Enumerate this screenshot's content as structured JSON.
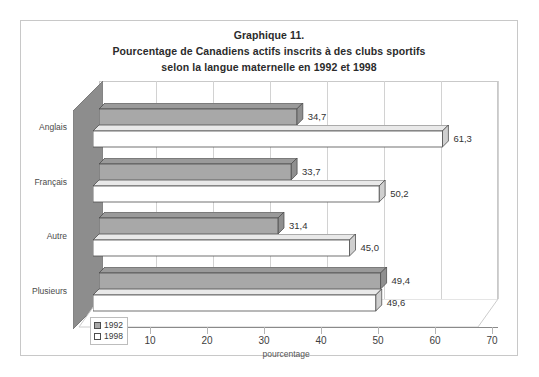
{
  "chart_data": {
    "type": "bar",
    "orientation": "horizontal",
    "title_lines": [
      "Graphique 11.",
      "Pourcentage de Canadiens actifs inscrits à des clubs sportifs",
      "selon la langue maternelle en 1992 et 1998"
    ],
    "categories": [
      "Anglais",
      "Français",
      "Autre",
      "Plusieurs"
    ],
    "series": [
      {
        "name": "1992",
        "color": "#a8a8a8",
        "values": [
          34.7,
          33.7,
          31.4,
          49.4
        ]
      },
      {
        "name": "1998",
        "color": "#ffffff",
        "values": [
          61.3,
          50.2,
          45.0,
          49.6
        ]
      }
    ],
    "value_labels": [
      {
        "category": "Anglais",
        "1992": "34,7",
        "1998": "61,3"
      },
      {
        "category": "Français",
        "1992": "33,7",
        "1998": "50,2"
      },
      {
        "category": "Autre",
        "1992": "31,4",
        "1998": "45,0"
      },
      {
        "category": "Plusieurs",
        "1992": "49,4",
        "1998": "49,6"
      }
    ],
    "xlabel": "pourcentage",
    "ylabel": "",
    "xlim": [
      0,
      70
    ],
    "xticks": [
      "0",
      "10",
      "20",
      "30",
      "40",
      "50",
      "60",
      "70"
    ],
    "grid": true,
    "legend_position": "bottom-left",
    "legend_entries": [
      "1992",
      "1998"
    ]
  },
  "legend": {
    "items": [
      {
        "label": "1992",
        "color": "#a8a8a8"
      },
      {
        "label": "1998",
        "color": "#ffffff"
      }
    ]
  }
}
